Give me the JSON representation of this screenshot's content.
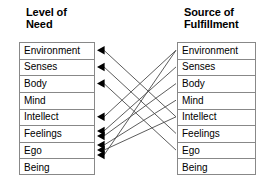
{
  "columns": {
    "left": {
      "title": "Level of\nNeed",
      "items": [
        {
          "label": "Environment"
        },
        {
          "label": "Senses"
        },
        {
          "label": "Body"
        },
        {
          "label": "Mind"
        },
        {
          "label": "Intellect"
        },
        {
          "label": "Feelings"
        },
        {
          "label": "Ego"
        },
        {
          "label": "Being"
        }
      ]
    },
    "right": {
      "title": "Source of\nFulfillment",
      "items": [
        {
          "label": "Environment"
        },
        {
          "label": "Senses"
        },
        {
          "label": "Body"
        },
        {
          "label": "Mind"
        },
        {
          "label": "Intellect"
        },
        {
          "label": "Feelings"
        },
        {
          "label": "Ego"
        },
        {
          "label": "Being"
        }
      ]
    }
  },
  "diagram": {
    "type": "bipartite-mapping",
    "arrow_direction": "right-to-left",
    "edge_color": "#4a4a4a",
    "arrowhead_color": "#000000",
    "border_color": "#888888",
    "edges": [
      {
        "from_right_index": 4,
        "to_left_index": 0
      },
      {
        "from_right_index": 5,
        "to_left_index": 1
      },
      {
        "from_right_index": 6,
        "to_left_index": 2
      },
      {
        "from_right_index": 0,
        "to_left_index": 4
      },
      {
        "from_right_index": 1,
        "to_left_index": 5
      },
      {
        "from_right_index": 2,
        "to_left_index": 5
      },
      {
        "from_right_index": 3,
        "to_left_index": 6
      },
      {
        "from_right_index": 4,
        "to_left_index": 6
      },
      {
        "from_right_index": 0,
        "to_left_index": 6
      }
    ]
  }
}
